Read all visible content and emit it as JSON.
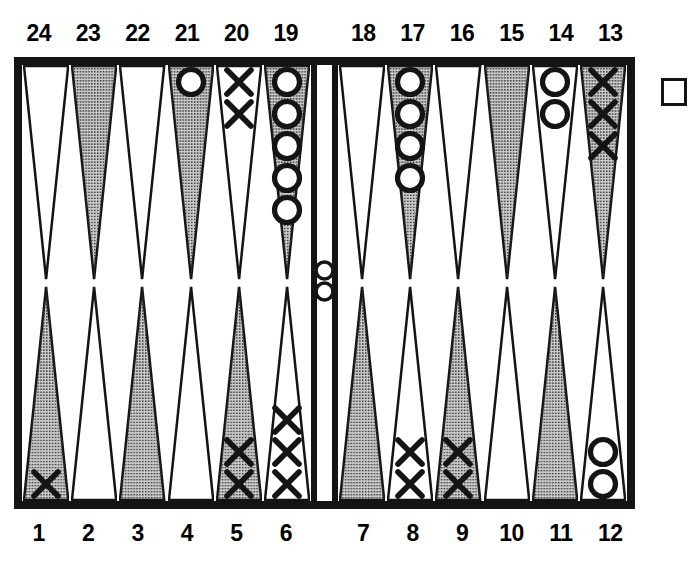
{
  "colors": {
    "ink": "#141414",
    "board_background": "#ffffff",
    "point_shaded_fill": "#c9c9c9",
    "point_light_fill": "#ffffff",
    "checker_o_fill": "#ffffff",
    "checker_o_stroke": "#141414",
    "checker_x_color": "#141414"
  },
  "labels": {
    "top_left": [
      "24",
      "23",
      "22",
      "21",
      "20",
      "19"
    ],
    "top_right": [
      "18",
      "17",
      "16",
      "15",
      "14",
      "13"
    ],
    "bottom_left": [
      "1",
      "2",
      "3",
      "4",
      "5",
      "6"
    ],
    "bottom_right": [
      "7",
      "8",
      "9",
      "10",
      "11",
      "12"
    ]
  },
  "points": {
    "24": {
      "label": "24",
      "shade": "light",
      "checker": null,
      "count": 0
    },
    "23": {
      "label": "23",
      "shade": "shaded",
      "checker": null,
      "count": 0
    },
    "22": {
      "label": "22",
      "shade": "light",
      "checker": null,
      "count": 0
    },
    "21": {
      "label": "21",
      "shade": "shaded",
      "checker": "O",
      "count": 1
    },
    "20": {
      "label": "20",
      "shade": "light",
      "checker": "X",
      "count": 2
    },
    "19": {
      "label": "19",
      "shade": "shaded",
      "checker": "O",
      "count": 5
    },
    "18": {
      "label": "18",
      "shade": "light",
      "checker": null,
      "count": 0
    },
    "17": {
      "label": "17",
      "shade": "shaded",
      "checker": "O",
      "count": 4
    },
    "16": {
      "label": "16",
      "shade": "light",
      "checker": null,
      "count": 0
    },
    "15": {
      "label": "15",
      "shade": "shaded",
      "checker": null,
      "count": 0
    },
    "14": {
      "label": "14",
      "shade": "light",
      "checker": "O",
      "count": 2
    },
    "13": {
      "label": "13",
      "shade": "shaded",
      "checker": "X",
      "count": 3
    },
    "12": {
      "label": "12",
      "shade": "light",
      "checker": "O",
      "count": 2
    },
    "11": {
      "label": "11",
      "shade": "shaded",
      "checker": null,
      "count": 0
    },
    "10": {
      "label": "10",
      "shade": "light",
      "checker": null,
      "count": 0
    },
    "9": {
      "label": "9",
      "shade": "shaded",
      "checker": "X",
      "count": 2
    },
    "8": {
      "label": "8",
      "shade": "light",
      "checker": "X",
      "count": 2
    },
    "7": {
      "label": "7",
      "shade": "shaded",
      "checker": null,
      "count": 0
    },
    "6": {
      "label": "6",
      "shade": "light",
      "checker": "X",
      "count": 3
    },
    "5": {
      "label": "5",
      "shade": "shaded",
      "checker": "X",
      "count": 2
    },
    "4": {
      "label": "4",
      "shade": "light",
      "checker": null,
      "count": 0
    },
    "3": {
      "label": "3",
      "shade": "shaded",
      "checker": null,
      "count": 0
    },
    "2": {
      "label": "2",
      "shade": "light",
      "checker": null,
      "count": 0
    },
    "1": {
      "label": "1",
      "shade": "shaded",
      "checker": "X",
      "count": 1
    }
  },
  "bar": {
    "checker": "O",
    "count": 2
  },
  "bear_off_tray": {
    "checker": null,
    "count": 0
  },
  "point_order": {
    "top_left": [
      "24",
      "23",
      "22",
      "21",
      "20",
      "19"
    ],
    "top_right": [
      "18",
      "17",
      "16",
      "15",
      "14",
      "13"
    ],
    "bottom_left": [
      "1",
      "2",
      "3",
      "4",
      "5",
      "6"
    ],
    "bottom_right": [
      "7",
      "8",
      "9",
      "10",
      "11",
      "12"
    ]
  }
}
